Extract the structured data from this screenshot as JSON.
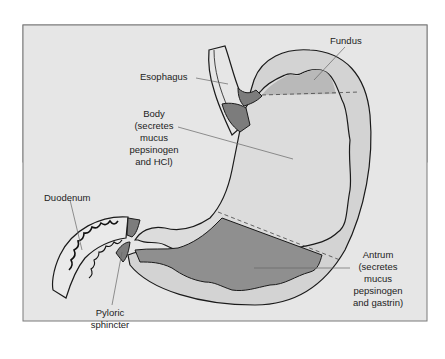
{
  "figure": {
    "type": "anatomical-diagram"
  },
  "labels": {
    "fundus": "Fundus",
    "esophagus": "Esophagus",
    "body": [
      "Body",
      "(secretes",
      "mucus",
      "pepsinogen",
      "and HCl)"
    ],
    "duodenum": "Duodenum",
    "pyloric": [
      "Pyloric",
      "sphincter"
    ],
    "antrum": [
      "Antrum",
      "(secretes",
      "mucus",
      "pepsinogen",
      "and gastrin)"
    ]
  },
  "colors": {
    "panel_bg": "#e6e6e6",
    "panel_border": "#7a7a7a",
    "stomach_wall": "#d3d3d3",
    "lumen": "#dcdcdc",
    "fundus_region": "#b9b9b9",
    "antrum_region": "#8f8f8f",
    "sphincter": "#7c7c7c",
    "outline": "#1a1a1a"
  }
}
